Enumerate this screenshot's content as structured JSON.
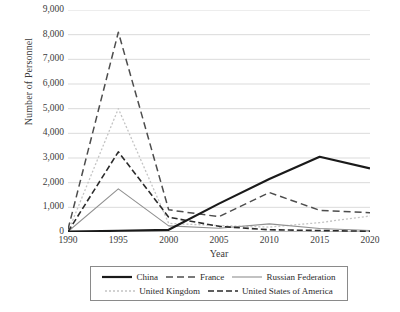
{
  "chart_data": {
    "type": "line",
    "title": "",
    "xlabel": "Year",
    "ylabel": "Number of Personnel",
    "x": [
      1990,
      1995,
      2000,
      2005,
      2010,
      2015,
      2020
    ],
    "xticklabels": [
      "1990",
      "1995",
      "2000",
      "2005",
      "2010",
      "2015",
      "2020"
    ],
    "yticklabels": [
      "0",
      "1,000",
      "2,000",
      "3,000",
      "4,000",
      "5,000",
      "6,000",
      "7,000",
      "8,000",
      "9,000"
    ],
    "ytickvalues": [
      0,
      1000,
      2000,
      3000,
      4000,
      5000,
      6000,
      7000,
      8000,
      9000
    ],
    "xlim": [
      1990,
      2020
    ],
    "ylim": [
      0,
      9000
    ],
    "grid": "horizontal",
    "legend_position": "below-axes",
    "series": [
      {
        "name": "China",
        "values": [
          20,
          50,
          90,
          1150,
          2150,
          3050,
          2580
        ],
        "color": "#1a1a1a",
        "style": "solid",
        "width": 2.2,
        "dasharray": ""
      },
      {
        "name": "France",
        "values": [
          110,
          8100,
          900,
          620,
          1600,
          880,
          780
        ],
        "color": "#4d4d4d",
        "style": "long-dash",
        "width": 1.5,
        "dasharray": "7,4"
      },
      {
        "name": "Russian Federation",
        "values": [
          20,
          1750,
          250,
          150,
          330,
          140,
          60
        ],
        "color": "#909090",
        "style": "solid",
        "width": 1.1,
        "dasharray": ""
      },
      {
        "name": "United Kingdom",
        "values": [
          10,
          5000,
          350,
          260,
          200,
          380,
          650
        ],
        "color": "#c4c4c4",
        "style": "dotted",
        "width": 1.3,
        "dasharray": "2,2"
      },
      {
        "name": "United States of America",
        "values": [
          10,
          3250,
          600,
          230,
          90,
          60,
          30
        ],
        "color": "#2b2b2b",
        "style": "dash-dot",
        "width": 1.6,
        "dasharray": "6,3"
      }
    ]
  },
  "axes": {
    "y_title": "Number of Personnel",
    "x_title": "Year"
  },
  "legend": {
    "rows": [
      [
        "China",
        "France",
        "Russian Federation"
      ],
      [
        "United Kingdom",
        "United States of America"
      ]
    ]
  }
}
